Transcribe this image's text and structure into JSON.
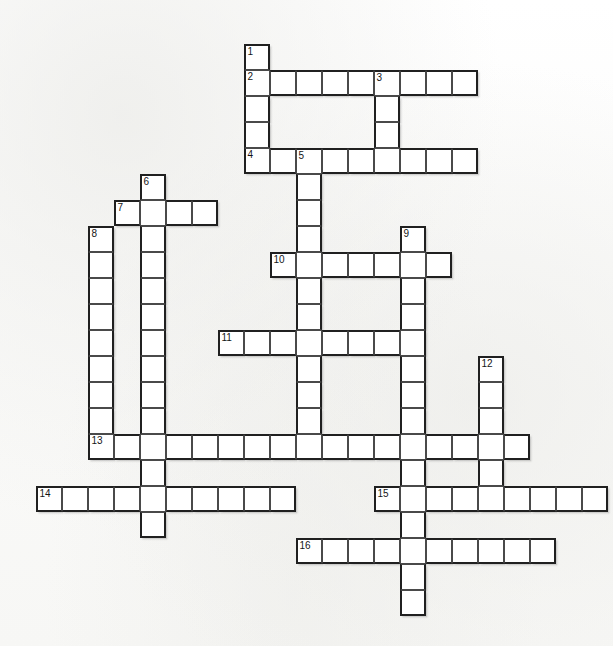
{
  "page": {
    "header_text": "",
    "background_color": "#fdfdfc",
    "cell_fill_color": "#ffffff",
    "cell_border_color": "#202020",
    "number_color": "#151515"
  },
  "grid": {
    "cell_size": 26,
    "origin_x": 36,
    "origin_y": 44,
    "columns": 21,
    "rows": 22
  },
  "numbers_visible": [
    "1",
    "2",
    "3",
    "4",
    "5",
    "6",
    "7",
    "8",
    "9",
    "10",
    "11",
    "12",
    "13",
    "14",
    "15",
    "16"
  ],
  "entries": [
    {
      "number": "1",
      "direction": "down",
      "col": 8,
      "row": 0,
      "length": 5
    },
    {
      "number": "2",
      "direction": "across",
      "col": 8,
      "row": 1,
      "length": 9
    },
    {
      "number": "3",
      "direction": "down",
      "col": 13,
      "row": 1,
      "length": 4
    },
    {
      "number": "4",
      "direction": "across",
      "col": 8,
      "row": 4,
      "length": 9
    },
    {
      "number": "5",
      "direction": "down",
      "col": 10,
      "row": 4,
      "length": 12
    },
    {
      "number": "6",
      "direction": "down",
      "col": 4,
      "row": 5,
      "length": 14
    },
    {
      "number": "7",
      "direction": "across",
      "col": 3,
      "row": 6,
      "length": 4
    },
    {
      "number": "8",
      "direction": "down",
      "col": 2,
      "row": 7,
      "length": 9
    },
    {
      "number": "9",
      "direction": "down",
      "col": 14,
      "row": 7,
      "length": 15
    },
    {
      "number": "10",
      "direction": "across",
      "col": 9,
      "row": 8,
      "length": 7
    },
    {
      "number": "11",
      "direction": "across",
      "col": 7,
      "row": 11,
      "length": 7
    },
    {
      "number": "12",
      "direction": "down",
      "col": 17,
      "row": 12,
      "length": 6
    },
    {
      "number": "13",
      "direction": "across",
      "col": 2,
      "row": 15,
      "length": 17
    },
    {
      "number": "14",
      "direction": "across",
      "col": 0,
      "row": 17,
      "length": 10
    },
    {
      "number": "15",
      "direction": "across",
      "col": 13,
      "row": 17,
      "length": 9
    },
    {
      "number": "16",
      "direction": "across",
      "col": 10,
      "row": 19,
      "length": 10
    }
  ]
}
